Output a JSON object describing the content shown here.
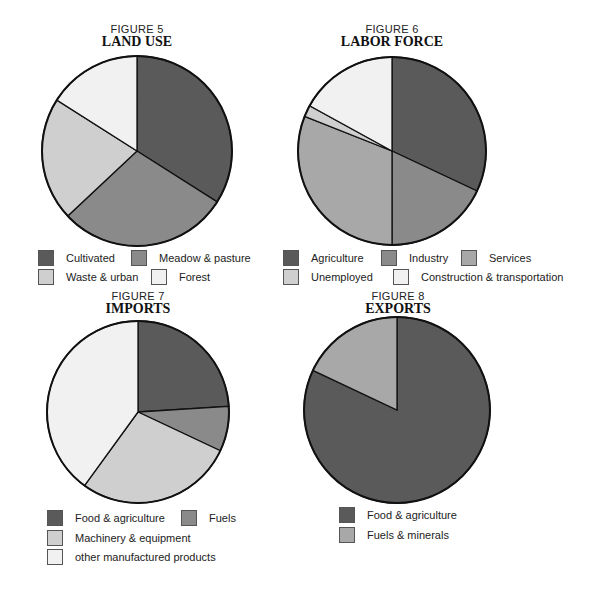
{
  "colors": {
    "dark": "#5a5a5a",
    "medium": "#8a8a8a",
    "medium_light": "#a8a8a8",
    "light": "#cfcfcf",
    "very_light": "#f1f1f1",
    "outline": "#111111"
  },
  "figures": [
    {
      "number": "FIGURE 5",
      "title": "LAND USE",
      "legend": [
        "Cultivated",
        "Meadow & pasture",
        "Waste & urban",
        "Forest"
      ]
    },
    {
      "number": "FIGURE  6",
      "title": "LABOR FORCE",
      "legend": [
        "Agriculture",
        "Industry",
        "Services",
        "Unemployed",
        "Construction & transportation"
      ]
    },
    {
      "number": "FIGURE 7",
      "title": "IMPORTS",
      "legend": [
        "Food & agriculture",
        "Fuels",
        "Machinery & equipment",
        "other manufactured products"
      ]
    },
    {
      "number": "FIGURE 8",
      "title": "EXPORTS",
      "legend": [
        "Food & agriculture",
        "Fuels & minerals"
      ]
    }
  ],
  "chart_data": [
    {
      "type": "pie",
      "title": "FIGURE 5 LAND USE",
      "categories": [
        "Cultivated",
        "Meadow & pasture",
        "Waste & urban",
        "Forest"
      ],
      "values": [
        34,
        29,
        21,
        16
      ],
      "unit": "percent (estimated from slice angles)",
      "start_angle": "12 o'clock, clockwise",
      "legend_position": "bottom"
    },
    {
      "type": "pie",
      "title": "FIGURE 6 LABOR FORCE",
      "categories": [
        "Agriculture",
        "Industry",
        "Services",
        "Unemployed",
        "Construction & transportation"
      ],
      "values": [
        32,
        18,
        31,
        2,
        17
      ],
      "unit": "percent (estimated from slice angles)",
      "start_angle": "12 o'clock, clockwise",
      "legend_position": "bottom"
    },
    {
      "type": "pie",
      "title": "FIGURE 7 IMPORTS",
      "categories": [
        "Food & agriculture",
        "Fuels",
        "Machinery & equipment",
        "other manufactured products"
      ],
      "values": [
        24,
        8,
        28,
        40
      ],
      "unit": "percent (estimated from slice angles)",
      "start_angle": "12 o'clock, clockwise",
      "legend_position": "bottom"
    },
    {
      "type": "pie",
      "title": "FIGURE 8 EXPORTS",
      "categories": [
        "Food & agriculture",
        "Fuels & minerals"
      ],
      "values": [
        82,
        18
      ],
      "unit": "percent (estimated from slice angles)",
      "start_angle": "12 o'clock, clockwise",
      "legend_position": "bottom"
    }
  ]
}
